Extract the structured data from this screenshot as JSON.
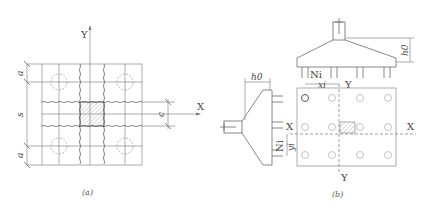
{
  "panel_a": {
    "caption": "(a)",
    "axis_x_label": "X",
    "axis_y_label": "Y",
    "dim_top_label": "a",
    "dim_middle_label": "s",
    "dim_bottom_label": "a",
    "dim_right_label": "c"
  },
  "panel_b": {
    "caption": "(b)",
    "elevation_top_height_label": "h0",
    "elevation_side_height_label": "h0",
    "pile_force_top_label": "Ni",
    "pile_force_side_label": "Ni",
    "distance_x_label": "xi",
    "distance_y_label": "yi",
    "plan_axis_x_left": "X",
    "plan_axis_x_right": "X",
    "plan_axis_y_top": "Y",
    "plan_axis_y_bottom": "Y",
    "pile_rows": 3,
    "pile_cols": 4
  }
}
